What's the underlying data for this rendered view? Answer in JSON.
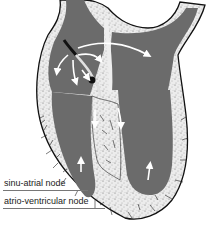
{
  "diagram": {
    "labels": [
      {
        "id": "sa",
        "text": "sinu-atrial node"
      },
      {
        "id": "av",
        "text": "atrio-ventricular node"
      }
    ],
    "colors": {
      "chamber": "#6b6b6b",
      "wall": "#e8e8e8",
      "outline": "#111111",
      "arrow": "#ffffff",
      "background": "#ffffff"
    }
  }
}
